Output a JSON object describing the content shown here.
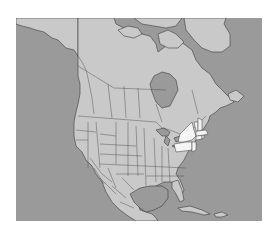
{
  "map": {
    "title": "",
    "region": "North America",
    "colors": {
      "ocean": "#9a9a9a",
      "land": "#c9c9c9",
      "highlight": "#f4f4f4",
      "borders": "#3a3a3a"
    },
    "highlighted_regions": [
      "New York",
      "Pennsylvania",
      "New Jersey",
      "Connecticut",
      "Rhode Island",
      "Massachusetts",
      "Vermont",
      "New Hampshire"
    ],
    "labels": []
  }
}
